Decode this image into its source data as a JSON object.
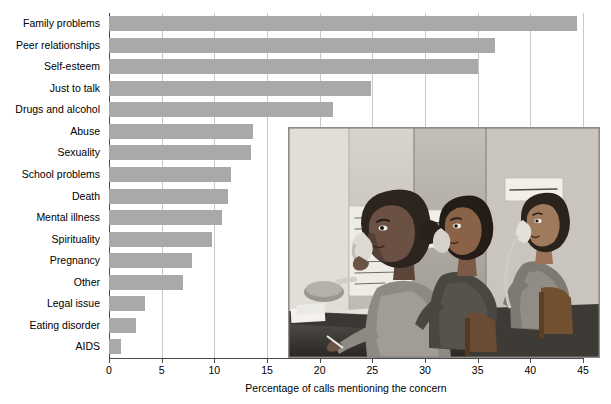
{
  "chart_data": {
    "type": "bar",
    "orientation": "horizontal",
    "title": "",
    "subtitle": "",
    "xlabel": "Percentage of calls mentioning the concern",
    "ylabel": "",
    "xlim": [
      0,
      45
    ],
    "xticks": [
      0,
      5,
      10,
      15,
      20,
      25,
      30,
      35,
      40,
      45
    ],
    "xtick_labels": [
      "0",
      "5",
      "10",
      "15",
      "20",
      "25",
      "30",
      "35",
      "40",
      "45"
    ],
    "grid": "vertical",
    "legend": "none",
    "bar_color": "#a9a9a9",
    "axis_color": "#4a4a4a",
    "gridline_color": "#c9c9c9",
    "categories": [
      "Family problems",
      "Peer relationships",
      "Self-esteem",
      "Just to talk",
      "Drugs and alcohol",
      "Abuse",
      "Sexuality",
      "School problems",
      "Death",
      "Mental illness",
      "Spirituality",
      "Pregnancy",
      "Other",
      "Legal issue",
      "Eating disorder",
      "AIDS"
    ],
    "values": [
      44.4,
      36.6,
      35.0,
      24.9,
      21.3,
      13.7,
      13.5,
      11.6,
      11.3,
      10.7,
      9.8,
      7.9,
      7.0,
      3.4,
      2.6,
      1.1
    ]
  },
  "photo": {
    "caption": "",
    "description": "Black and white photograph of three teenage volunteers seated at a counter answering telephones on a crisis hotline, with handwritten notes taped to the wall behind them",
    "notes": [
      "Share with you how we keep and the you and they keep coming here again and it",
      "LISTEN WHEN SOMEONE SAYS A WORD",
      "SMILE - GET OUT"
    ]
  }
}
